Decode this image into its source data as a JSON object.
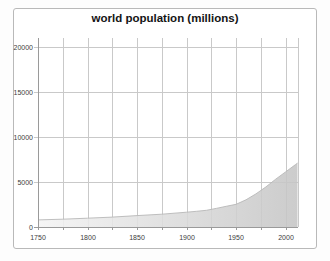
{
  "title": "world population (millions)",
  "chart_data": {
    "type": "area",
    "title": "world population (millions)",
    "series_name": "world population",
    "x": [
      1750,
      1775,
      1800,
      1825,
      1850,
      1875,
      1900,
      1910,
      1920,
      1930,
      1940,
      1950,
      1960,
      1970,
      1980,
      1990,
      2000,
      2010,
      2012
    ],
    "y": [
      791,
      870,
      978,
      1100,
      1262,
      1420,
      1650,
      1750,
      1860,
      2070,
      2300,
      2519,
      3018,
      3682,
      4440,
      5310,
      6127,
      6930,
      7100
    ],
    "xlabel": "",
    "ylabel": "",
    "xlim": [
      1750,
      2012
    ],
    "ylim": [
      0,
      21000
    ],
    "x_ticks": [
      1750,
      1800,
      1850,
      1900,
      1950,
      2000
    ],
    "x_tick_labels": [
      "1750",
      "1800",
      "1850",
      "1900",
      "1950",
      "2000"
    ],
    "x_grid_step_years": 25,
    "y_ticks": [
      0,
      5000,
      10000,
      15000,
      20000
    ],
    "y_tick_labels": [
      "0",
      "5000",
      "10000",
      "15000",
      "20000"
    ],
    "grid": true,
    "legend_position": "none",
    "colors": {
      "fill_gradient_left": "#f4f4f4",
      "fill_gradient_right": "#c5c5c5",
      "area_edge": "#b8b8b8",
      "grid_line": "#c9c9c9",
      "axis_line": "#9a9a9a",
      "tick_text": "#3d3d3d",
      "title_text": "#141414",
      "frame_border": "#b9b9b9",
      "plot_background": "#ffffff"
    }
  }
}
